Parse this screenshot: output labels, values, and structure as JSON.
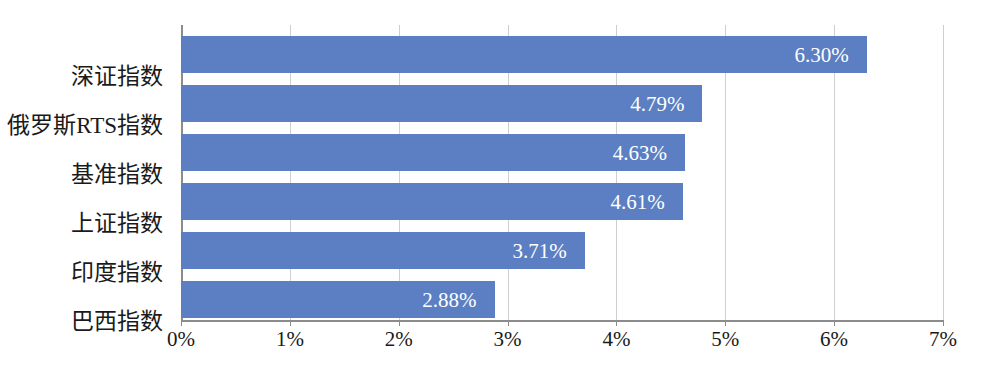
{
  "chart_data": {
    "type": "bar",
    "orientation": "horizontal",
    "title": "",
    "subtitle": "",
    "xlabel": "",
    "ylabel": "",
    "categories": [
      "深证指数",
      "俄罗斯RTS指数",
      "基准指数",
      "上证指数",
      "印度指数",
      "巴西指数"
    ],
    "values": [
      6.3,
      4.79,
      4.63,
      4.61,
      3.71,
      2.88
    ],
    "data_labels": [
      "6.30%",
      "4.79%",
      "4.63%",
      "4.61%",
      "3.71%",
      "2.88%"
    ],
    "xlim": [
      0,
      7
    ],
    "xtick_values": [
      0,
      1,
      2,
      3,
      4,
      5,
      6,
      7
    ],
    "xtick_labels": [
      "0%",
      "1%",
      "2%",
      "3%",
      "4%",
      "5%",
      "6%",
      "7%"
    ],
    "grid": true,
    "grid_axis": "x",
    "legend": false,
    "legend_position": "none",
    "bar_color": "#5b7fc2",
    "grid_color": "#cfcfcf",
    "axis_color": "#8c8c8c",
    "label_text_color": "#ffffff",
    "tick_text_color": "#1a1a1a"
  }
}
